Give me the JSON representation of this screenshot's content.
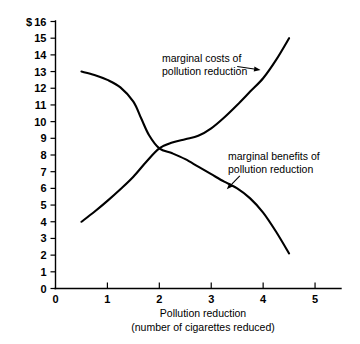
{
  "chart_data": {
    "type": "line",
    "title": "",
    "xlabel": "Pollution reduction (number of cigarettes reduced)",
    "ylabel": "$",
    "xlim": [
      0,
      5.5
    ],
    "ylim": [
      0,
      16
    ],
    "grid": false,
    "legend_position": "inline-annotations",
    "x_ticks": [
      0,
      1,
      2,
      3,
      4,
      5
    ],
    "x_tick_labels": [
      "0",
      "1",
      "2",
      "3",
      "4",
      "5"
    ],
    "y_ticks": [
      0,
      1,
      2,
      3,
      4,
      5,
      6,
      7,
      8,
      9,
      10,
      11,
      12,
      13,
      14,
      15,
      16
    ],
    "y_tick_labels": [
      "0",
      "1",
      "2",
      "3",
      "4",
      "5",
      "6",
      "7",
      "8",
      "9",
      "10",
      "11",
      "12",
      "13",
      "14",
      "15",
      "16"
    ],
    "intersection": {
      "x": 2.0,
      "y": 8.4
    },
    "series": [
      {
        "name": "marginal costs of pollution reduction",
        "points": [
          {
            "x": 0.5,
            "y": 4.0
          },
          {
            "x": 0.75,
            "y": 4.6
          },
          {
            "x": 1.0,
            "y": 5.25
          },
          {
            "x": 1.25,
            "y": 5.95
          },
          {
            "x": 1.5,
            "y": 6.7
          },
          {
            "x": 1.75,
            "y": 7.6
          },
          {
            "x": 2.0,
            "y": 8.4
          },
          {
            "x": 2.25,
            "y": 8.75
          },
          {
            "x": 2.5,
            "y": 8.95
          },
          {
            "x": 2.75,
            "y": 9.15
          },
          {
            "x": 3.0,
            "y": 9.6
          },
          {
            "x": 3.25,
            "y": 10.25
          },
          {
            "x": 3.5,
            "y": 11.0
          },
          {
            "x": 3.75,
            "y": 11.8
          },
          {
            "x": 4.0,
            "y": 12.6
          },
          {
            "x": 4.25,
            "y": 13.7
          },
          {
            "x": 4.5,
            "y": 15.0
          }
        ]
      },
      {
        "name": "marginal benefits of pollution reduction",
        "points": [
          {
            "x": 0.5,
            "y": 13.0
          },
          {
            "x": 0.75,
            "y": 12.8
          },
          {
            "x": 1.0,
            "y": 12.5
          },
          {
            "x": 1.25,
            "y": 12.05
          },
          {
            "x": 1.5,
            "y": 11.2
          },
          {
            "x": 1.65,
            "y": 10.2
          },
          {
            "x": 1.8,
            "y": 9.2
          },
          {
            "x": 2.0,
            "y": 8.4
          },
          {
            "x": 2.25,
            "y": 8.1
          },
          {
            "x": 2.5,
            "y": 7.75
          },
          {
            "x": 2.75,
            "y": 7.3
          },
          {
            "x": 3.0,
            "y": 6.85
          },
          {
            "x": 3.25,
            "y": 6.4
          },
          {
            "x": 3.5,
            "y": 6.0
          },
          {
            "x": 3.75,
            "y": 5.4
          },
          {
            "x": 4.0,
            "y": 4.55
          },
          {
            "x": 4.25,
            "y": 3.4
          },
          {
            "x": 4.5,
            "y": 2.1
          }
        ]
      }
    ],
    "annotations": [
      {
        "id": "costs",
        "line1": "marginal costs of",
        "line2": "pollution reduction",
        "arrow_from": {
          "x": 3.5,
          "y": 13.3
        },
        "arrow_to": {
          "x": 3.95,
          "y": 13.1
        }
      },
      {
        "id": "benefits",
        "line1": "marginal benefits of",
        "line2": "pollution reduction",
        "arrow_from": {
          "x": 3.55,
          "y": 6.75
        },
        "arrow_to": {
          "x": 3.3,
          "y": 5.95
        }
      }
    ],
    "caption_lines": [
      "Pollution reduction",
      "(number of cigarettes reduced)"
    ]
  }
}
